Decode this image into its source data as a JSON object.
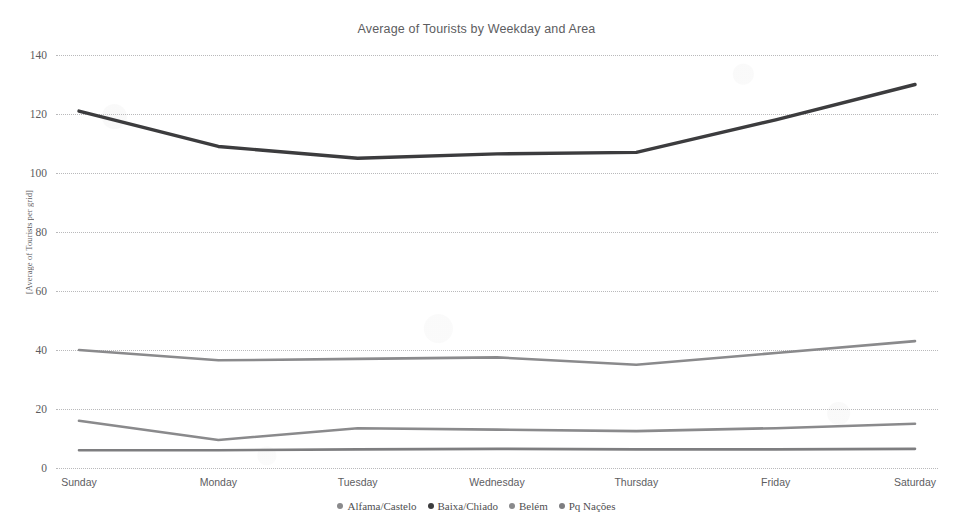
{
  "chart_data": {
    "type": "line",
    "title": "Average of Tourists by Weekday and Area",
    "xlabel": "",
    "ylabel": "[Average of Tourists per grid]",
    "categories": [
      "Sunday",
      "Monday",
      "Tuesday",
      "Wednesday",
      "Thursday",
      "Friday",
      "Saturday"
    ],
    "ylim": [
      0,
      140
    ],
    "yticks": [
      0,
      20,
      40,
      60,
      80,
      100,
      120,
      140
    ],
    "grid": "horizontal-dotted",
    "legend_position": "bottom-center",
    "series": [
      {
        "name": "Alfama/Castelo",
        "color": "#8a8a8c",
        "values": [
          16,
          9.5,
          13.5,
          13,
          12.5,
          13.5,
          15
        ]
      },
      {
        "name": "Baixa/Chiado",
        "color": "#3c3c3e",
        "values": [
          121,
          109,
          105,
          106.5,
          107,
          118,
          130
        ]
      },
      {
        "name": "Belém",
        "color": "#8a8a8c",
        "values": [
          40,
          36.5,
          37,
          37.5,
          35,
          39,
          43
        ]
      },
      {
        "name": "Pq Nações",
        "color": "#7e7e80",
        "values": [
          6,
          6,
          6.3,
          6.5,
          6.3,
          6.3,
          6.5
        ]
      }
    ]
  },
  "legend": {
    "items": [
      {
        "label": "Alfama/Castelo",
        "marker": "legend-dot"
      },
      {
        "label": "Baixa/Chiado",
        "marker": "legend-dot"
      },
      {
        "label": "Belém",
        "marker": "legend-dot"
      },
      {
        "label": "Pq Nações",
        "marker": "legend-dot"
      }
    ]
  },
  "axis": {
    "y_title": "[Average of Tourists per grid]",
    "y_ticks": [
      "140",
      "120",
      "100",
      "80",
      "60",
      "40",
      "20",
      "0"
    ],
    "x_ticks": [
      "Sunday",
      "Monday",
      "Tuesday",
      "Wednesday",
      "Thursday",
      "Friday",
      "Saturday"
    ]
  },
  "colors": {
    "background": "#ffffff",
    "gridline": "#b9b9bb",
    "text": "#5d5d5f",
    "series_dark": "#3c3c3e",
    "series_gray": "#8a8a8c"
  }
}
